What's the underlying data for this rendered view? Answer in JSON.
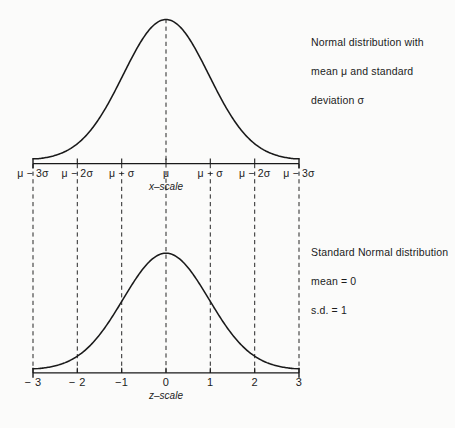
{
  "figure": {
    "background_color": "#fbfbfa",
    "ink_color": "#1a1a1a"
  },
  "annotations": {
    "top": {
      "name": "normal-distribution-note",
      "line1": "Normal distribution with",
      "line2": "mean μ and standard",
      "line3": "deviation σ"
    },
    "bottom": {
      "name": "standard-normal-note",
      "line1": "Standard Normal distribution",
      "line2": "mean = 0",
      "line3": "s.d.   = 1"
    }
  },
  "top_axis": {
    "caption": "x–scale",
    "labels": [
      "μ − 3σ",
      "μ − 2σ",
      "μ − σ",
      "μ",
      "μ − σ",
      "μ − 2σ",
      "μ − 3σ"
    ]
  },
  "bottom_axis": {
    "caption": "z–scale",
    "labels": [
      "− 3",
      "− 2",
      "−1",
      "0",
      "1",
      "2",
      "3"
    ]
  },
  "chart_data": {
    "type": "line",
    "panels": [
      {
        "name": "normal-distribution-curve",
        "xlabel": "x–scale",
        "ylabel": "",
        "annotation": "Normal distribution with mean μ and standard deviation σ",
        "x_tick_labels": [
          "μ − 3σ",
          "μ − 2σ",
          "μ − σ",
          "μ",
          "μ − σ",
          "μ − 2σ",
          "μ − 3σ"
        ],
        "x_tick_values": [
          -3,
          -2,
          -1,
          0,
          1,
          2,
          3
        ],
        "xlim": [
          -3.1,
          3.1
        ],
        "ylim": [
          0,
          1
        ],
        "grid": false,
        "legend": null,
        "series": [
          {
            "name": "pdf",
            "formula": "exp(-z^2/2)",
            "x": [
              -3.0,
              -2.75,
              -2.5,
              -2.25,
              -2.0,
              -1.75,
              -1.5,
              -1.25,
              -1.0,
              -0.75,
              -0.5,
              -0.25,
              0.0,
              0.25,
              0.5,
              0.75,
              1.0,
              1.25,
              1.5,
              1.75,
              2.0,
              2.25,
              2.5,
              2.75,
              3.0
            ],
            "y": [
              0.011,
              0.023,
              0.044,
              0.079,
              0.135,
              0.216,
              0.325,
              0.458,
              0.607,
              0.755,
              0.882,
              0.969,
              1.0,
              0.969,
              0.882,
              0.755,
              0.607,
              0.458,
              0.325,
              0.216,
              0.135,
              0.079,
              0.044,
              0.023,
              0.011
            ]
          }
        ]
      },
      {
        "name": "standard-normal-curve",
        "xlabel": "z–scale",
        "ylabel": "",
        "annotation": "Standard Normal distribution mean = 0 s.d. = 1",
        "x_tick_labels": [
          "− 3",
          "− 2",
          "−1",
          "0",
          "1",
          "2",
          "3"
        ],
        "x_tick_values": [
          -3,
          -2,
          -1,
          0,
          1,
          2,
          3
        ],
        "xlim": [
          -3.1,
          3.1
        ],
        "ylim": [
          0,
          1
        ],
        "grid": false,
        "legend": null,
        "series": [
          {
            "name": "pdf",
            "formula": "exp(-z^2/2)",
            "x": [
              -3.0,
              -2.75,
              -2.5,
              -2.25,
              -2.0,
              -1.75,
              -1.5,
              -1.25,
              -1.0,
              -0.75,
              -0.5,
              -0.25,
              0.0,
              0.25,
              0.5,
              0.75,
              1.0,
              1.25,
              1.5,
              1.75,
              2.0,
              2.25,
              2.5,
              2.75,
              3.0
            ],
            "y": [
              0.011,
              0.023,
              0.044,
              0.079,
              0.135,
              0.216,
              0.325,
              0.458,
              0.607,
              0.755,
              0.882,
              0.969,
              1.0,
              0.969,
              0.882,
              0.755,
              0.607,
              0.458,
              0.325,
              0.216,
              0.135,
              0.079,
              0.044,
              0.023,
              0.011
            ]
          }
        ]
      }
    ]
  }
}
